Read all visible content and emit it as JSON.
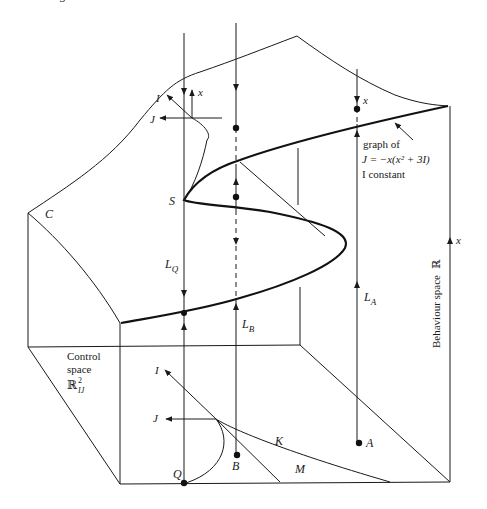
{
  "figure": {
    "top_fragment": "3",
    "labels": {
      "C": "C",
      "S": "S",
      "Q": "Q",
      "B": "B",
      "A": "A",
      "K": "K",
      "M": "M",
      "L_Q": "L",
      "L_Q_sub": "Q",
      "L_B": "L",
      "L_B_sub": "B",
      "L_A": "L",
      "L_A_sub": "A",
      "inset_I": "I",
      "inset_J": "J",
      "inset_x": "x",
      "control_I": "I",
      "control_J": "J",
      "A_line_x": "x",
      "behaviour_axis_x": "x"
    },
    "annotation": {
      "line1": "graph of",
      "line2": "J = −x(x² + 3I)",
      "line3": "I constant"
    },
    "control_space": {
      "line1": "Control",
      "line2": "space",
      "symbol": "ℝ",
      "superscript": "2",
      "subscript": "IJ"
    },
    "behaviour_space": {
      "label": "Behaviour space",
      "symbol": "ℝ"
    }
  }
}
